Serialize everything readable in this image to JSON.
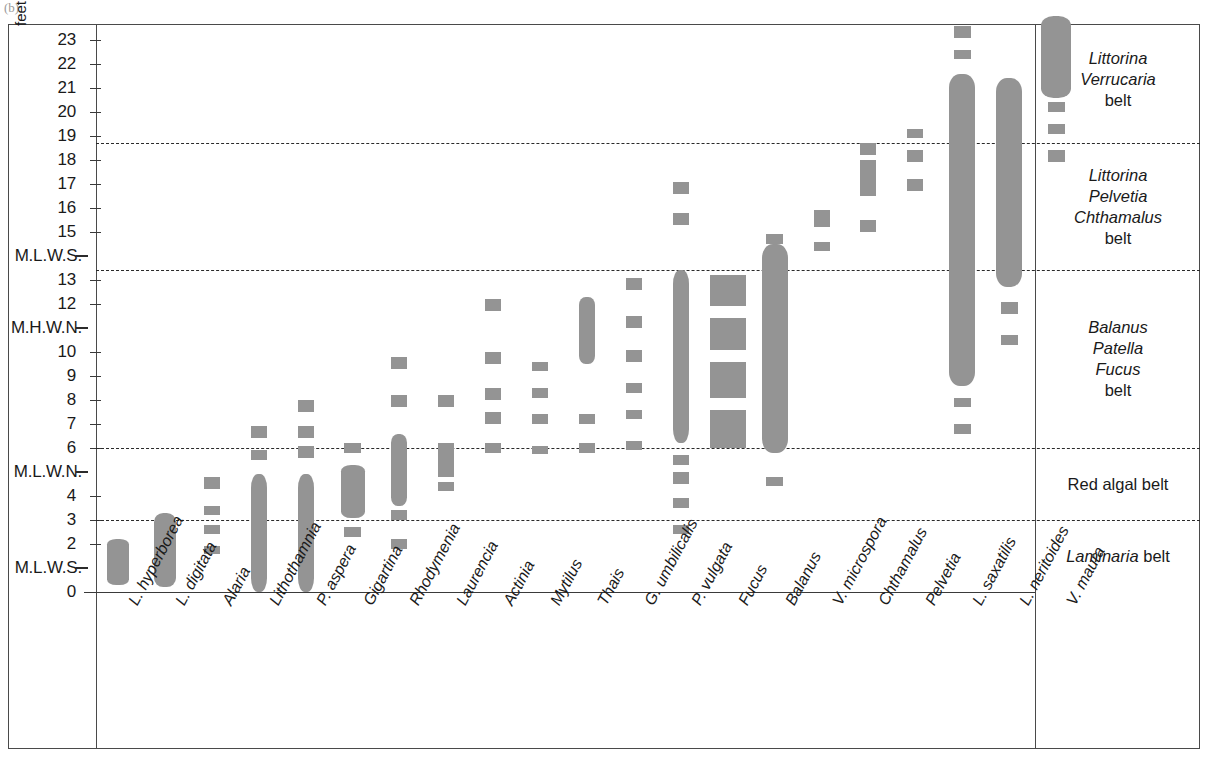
{
  "figure": {
    "corner_mark": "(b)",
    "unit_label": "feet"
  },
  "chart_data": {
    "type": "bar",
    "title": "",
    "xlabel": "",
    "ylabel": "feet",
    "ylim": [
      0,
      24
    ],
    "grid": false,
    "legend_position": "right",
    "orientation": "vertical-range-bars",
    "note": "Intertidal vertical zonation: each species column shows its vertical range on the shore (solid bar = main/continuous range, separated squares = sparse/occasional occurrence).",
    "y_axis_ticks": [
      {
        "label": "23",
        "value": 23,
        "type": "tick"
      },
      {
        "label": "22",
        "value": 22,
        "type": "tick"
      },
      {
        "label": "21",
        "value": 21,
        "type": "tick"
      },
      {
        "label": "20",
        "value": 20,
        "type": "tick"
      },
      {
        "label": "19",
        "value": 19,
        "type": "tick"
      },
      {
        "label": "18",
        "value": 18,
        "type": "tick"
      },
      {
        "label": "17",
        "value": 17,
        "type": "tick"
      },
      {
        "label": "16",
        "value": 16,
        "type": "tick"
      },
      {
        "label": "15",
        "value": 15,
        "type": "tick"
      },
      {
        "label": "M.L.W.S.",
        "value": 14,
        "type": "datum"
      },
      {
        "label": "13",
        "value": 13,
        "type": "tick"
      },
      {
        "label": "12",
        "value": 12,
        "type": "tick"
      },
      {
        "label": "M.H.W.N.",
        "value": 11,
        "type": "datum"
      },
      {
        "label": "10",
        "value": 10,
        "type": "tick"
      },
      {
        "label": "9",
        "value": 9,
        "type": "tick"
      },
      {
        "label": "8",
        "value": 8,
        "type": "tick"
      },
      {
        "label": "7",
        "value": 7,
        "type": "tick"
      },
      {
        "label": "6",
        "value": 6,
        "type": "tick"
      },
      {
        "label": "M.L.W.N.",
        "value": 5,
        "type": "datum"
      },
      {
        "label": "4",
        "value": 4,
        "type": "tick"
      },
      {
        "label": "3",
        "value": 3,
        "type": "tick"
      },
      {
        "label": "2",
        "value": 2,
        "type": "tick"
      },
      {
        "label": "M.L.W.S.",
        "value": 1,
        "type": "datum"
      },
      {
        "label": "0",
        "value": 0,
        "type": "tick"
      }
    ],
    "zone_boundaries": [
      18.7,
      13.4,
      6.0,
      3.0
    ],
    "categories": [
      "L. hyperborea",
      "L. digitata",
      "Alaria",
      "Lithothamnia",
      "P. aspera",
      "Gigartina",
      "Rhodymenia",
      "Laurencia",
      "Actinia",
      "Mytilus",
      "Thais",
      "G. umbilicalis",
      "P. vulgata",
      "Fucus",
      "Balanus",
      "V. microspora",
      "Chthamalus",
      "Pelvetia",
      "L. saxatilis",
      "L. neritoides",
      "V. maura"
    ],
    "series": [
      {
        "name": "L. hyperborea",
        "range": [
          0.3,
          2.2
        ],
        "solid": [
          [
            0.3,
            2.2
          ]
        ],
        "dotted": []
      },
      {
        "name": "L. digitata",
        "range": [
          0.2,
          3.3
        ],
        "solid": [
          [
            0.2,
            3.3
          ]
        ],
        "dotted": []
      },
      {
        "name": "Alaria",
        "range": [
          1.6,
          5.0
        ],
        "solid": [],
        "dotted": [
          [
            1.6,
            1.9
          ],
          [
            2.4,
            2.8
          ],
          [
            3.2,
            3.6
          ],
          [
            4.3,
            4.8
          ]
        ]
      },
      {
        "name": "Lithothamnia",
        "range": [
          0.0,
          6.9
        ],
        "solid": [
          [
            0.0,
            4.9
          ]
        ],
        "dotted": [
          [
            5.5,
            5.9
          ],
          [
            6.4,
            6.9
          ]
        ]
      },
      {
        "name": "P. aspera",
        "range": [
          0.0,
          8.0
        ],
        "solid": [
          [
            0.0,
            4.9
          ]
        ],
        "dotted": [
          [
            5.6,
            6.1
          ],
          [
            6.4,
            6.9
          ],
          [
            7.5,
            8.0
          ]
        ]
      },
      {
        "name": "Gigartina",
        "range": [
          2.3,
          6.1
        ],
        "solid": [
          [
            3.1,
            5.3
          ]
        ],
        "dotted": [
          [
            2.3,
            2.7
          ],
          [
            5.8,
            6.2
          ]
        ]
      },
      {
        "name": "Rhodymenia",
        "range": [
          1.8,
          9.7
        ],
        "solid": [
          [
            3.6,
            6.6
          ]
        ],
        "dotted": [
          [
            1.8,
            2.2
          ],
          [
            3.0,
            3.4
          ],
          [
            7.7,
            8.2
          ],
          [
            9.3,
            9.8
          ]
        ]
      },
      {
        "name": "Laurencia",
        "range": [
          4.2,
          8.1
        ],
        "solid": [
          [
            4.8,
            6.2
          ]
        ],
        "dotted": [
          [
            4.2,
            4.6
          ],
          [
            7.7,
            8.2
          ]
        ]
      },
      {
        "name": "Actinia",
        "range": [
          5.8,
          12.1
        ],
        "solid": [],
        "dotted": [
          [
            5.8,
            6.2
          ],
          [
            7.0,
            7.5
          ],
          [
            8.0,
            8.5
          ],
          [
            9.5,
            10.0
          ],
          [
            11.7,
            12.2
          ]
        ]
      },
      {
        "name": "Mytilus",
        "range": [
          5.8,
          9.6
        ],
        "solid": [],
        "dotted": [
          [
            5.8,
            6.1
          ],
          [
            7.0,
            7.4
          ],
          [
            8.1,
            8.5
          ],
          [
            9.2,
            9.6
          ]
        ]
      },
      {
        "name": "Thais",
        "range": [
          5.8,
          12.5
        ],
        "solid": [
          [
            9.5,
            12.3
          ]
        ],
        "dotted": [
          [
            5.8,
            6.2
          ],
          [
            7.0,
            7.4
          ]
        ]
      },
      {
        "name": "G. umbilicalis",
        "range": [
          5.9,
          13.0
        ],
        "solid": [],
        "dotted": [
          [
            5.9,
            6.3
          ],
          [
            7.2,
            7.6
          ],
          [
            8.3,
            8.7
          ],
          [
            9.6,
            10.1
          ],
          [
            11.0,
            11.5
          ],
          [
            12.6,
            13.1
          ]
        ]
      },
      {
        "name": "P. vulgata",
        "range": [
          2.4,
          17.0
        ],
        "solid": [
          [
            6.2,
            13.4
          ]
        ],
        "dotted": [
          [
            2.4,
            2.8
          ],
          [
            3.5,
            3.9
          ],
          [
            4.5,
            5.0
          ],
          [
            5.3,
            5.7
          ],
          [
            15.3,
            15.8
          ],
          [
            16.6,
            17.1
          ]
        ]
      },
      {
        "name": "Fucus",
        "range": [
          6.0,
          13.2
        ],
        "solid": [
          [
            6.0,
            7.6
          ],
          [
            8.1,
            9.6
          ],
          [
            10.1,
            11.4
          ],
          [
            11.9,
            13.2
          ]
        ],
        "dotted": []
      },
      {
        "name": "Balanus",
        "range": [
          4.4,
          14.9
        ],
        "solid": [
          [
            5.8,
            14.5
          ]
        ],
        "dotted": [
          [
            4.4,
            4.8
          ],
          [
            14.5,
            14.9
          ]
        ]
      },
      {
        "name": "V. microspora",
        "range": [
          14.2,
          15.9
        ],
        "solid": [],
        "dotted": [
          [
            14.2,
            14.6
          ],
          [
            15.2,
            15.9
          ]
        ]
      },
      {
        "name": "Chthamalus",
        "range": [
          15.0,
          18.6
        ],
        "solid": [
          [
            16.5,
            18.0
          ]
        ],
        "dotted": [
          [
            15.0,
            15.5
          ],
          [
            18.2,
            18.7
          ]
        ]
      },
      {
        "name": "Pelvetia",
        "range": [
          16.7,
          19.2
        ],
        "solid": [],
        "dotted": [
          [
            16.7,
            17.2
          ],
          [
            17.9,
            18.4
          ],
          [
            18.9,
            19.3
          ]
        ]
      },
      {
        "name": "L. saxatilis",
        "range": [
          6.6,
          23.6
        ],
        "solid": [
          [
            8.6,
            21.6
          ]
        ],
        "dotted": [
          [
            6.6,
            7.0
          ],
          [
            7.7,
            8.1
          ],
          [
            22.2,
            22.6
          ],
          [
            23.1,
            23.6
          ]
        ]
      },
      {
        "name": "L. neritoides",
        "range": [
          10.3,
          24.0
        ],
        "solid": [
          [
            12.7,
            21.4
          ]
        ],
        "dotted": [
          [
            10.3,
            10.7
          ],
          [
            11.6,
            12.1
          ]
        ]
      },
      {
        "name": "V. maura",
        "range": [
          17.9,
          24.0
        ],
        "solid": [
          [
            20.6,
            24.0
          ]
        ],
        "dotted": [
          [
            17.9,
            18.4
          ],
          [
            19.1,
            19.5
          ],
          [
            20.0,
            20.4
          ]
        ]
      }
    ],
    "belts": [
      {
        "names": [
          "Littorina",
          "Verrucaria"
        ],
        "suffix": "belt"
      },
      {
        "names": [
          "Littorina",
          "Pelvetia",
          "Chthamalus"
        ],
        "suffix": "belt"
      },
      {
        "names": [
          "Balanus",
          "Patella",
          "Fucus"
        ],
        "suffix": "belt"
      },
      {
        "names": [],
        "plain": "Red algal belt"
      },
      {
        "names": [
          "Laminaria"
        ],
        "suffix": "belt",
        "inline": true
      }
    ]
  },
  "colors": {
    "bar_fill": "#949494",
    "frame": "#4a4a4a",
    "text": "#1a1a1a",
    "dash": "#2a2a2a"
  }
}
